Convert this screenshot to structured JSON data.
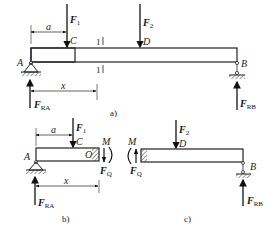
{
  "figure": {
    "a": {
      "caption": "a)",
      "point_labels": {
        "A": "A",
        "B": "B",
        "C": "C",
        "D": "D"
      },
      "forces": {
        "F1": {
          "main": "F",
          "sub": "1"
        },
        "F2": {
          "main": "F",
          "sub": "2"
        },
        "FRA": {
          "main": "F",
          "sub": "RA"
        },
        "FRB": {
          "main": "F",
          "sub": "RB"
        }
      },
      "dimensions": {
        "a": "a",
        "x": "x"
      },
      "section_mark": "1"
    },
    "b": {
      "caption": "b)",
      "point_labels": {
        "A": "A",
        "C": "C",
        "O": "O"
      },
      "forces": {
        "F1": {
          "main": "F",
          "sub": "1"
        },
        "FRA": {
          "main": "F",
          "sub": "RA"
        },
        "FQ": {
          "main": "F",
          "sub": "Q"
        },
        "M": "M"
      },
      "dimensions": {
        "a": "a",
        "x": "x"
      }
    },
    "c": {
      "caption": "c)",
      "point_labels": {
        "D": "D",
        "B": "B"
      },
      "forces": {
        "F2": {
          "main": "F",
          "sub": "2"
        },
        "FRB": {
          "main": "F",
          "sub": "RB"
        },
        "FQ": {
          "main": "F",
          "sub": "Q"
        },
        "M": "M"
      }
    }
  }
}
